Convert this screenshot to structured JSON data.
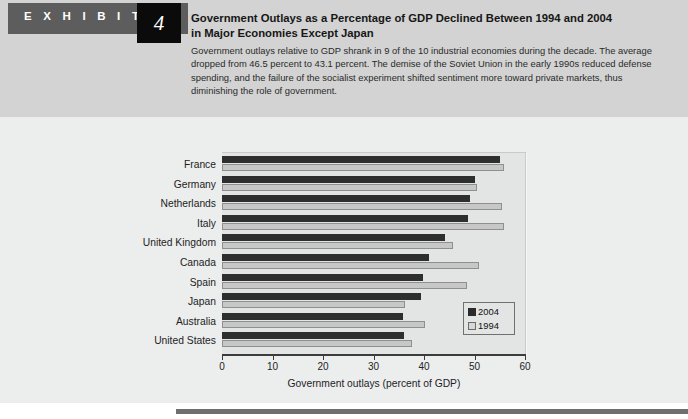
{
  "exhibit": {
    "label": "E X H I B I T",
    "number": "4"
  },
  "header": {
    "title_line1": "Government Outlays as a Percentage of GDP Declined Between 1994 and 2004",
    "title_line2": "in Major Economies Except Japan",
    "body": "Government outlays relative to GDP shrank in 9 of the 10 industrial economies during the decade. The average dropped from 46.5 percent to 43.1 percent. The demise of the Soviet Union in the early 1990s reduced defense spending, and the failure of the socialist experiment shifted sentiment more toward private markets, thus diminishing the role of government."
  },
  "chart_data": {
    "type": "bar",
    "orientation": "horizontal",
    "title": "",
    "xlabel": "Government outlays (percent of GDP)",
    "ylabel": "",
    "xlim": [
      0,
      60
    ],
    "xticks": [
      0,
      10,
      20,
      30,
      40,
      50,
      60
    ],
    "xtick_labels": [
      "0",
      "10",
      "20",
      "30",
      "40",
      "50",
      "60"
    ],
    "grid": false,
    "legend_position": "inside-bottom-right",
    "categories": [
      "France",
      "Germany",
      "Netherlands",
      "Italy",
      "United Kingdom",
      "Canada",
      "Spain",
      "Japan",
      "Australia",
      "United States"
    ],
    "series": [
      {
        "name": "2004",
        "color": "#2e2e2e",
        "values": [
          55.0,
          50.1,
          49.2,
          48.8,
          44.2,
          41.0,
          39.8,
          39.5,
          35.8,
          36.0
        ]
      },
      {
        "name": "1994",
        "color": "#c6c7c6",
        "values": [
          55.8,
          50.4,
          55.4,
          55.8,
          45.7,
          50.9,
          48.5,
          36.2,
          40.2,
          37.6
        ]
      }
    ]
  },
  "colors": {
    "header_band": "#d2d3d2",
    "chart_panel": "#eceded",
    "plot_area": "#e3e4e4",
    "axis": "#3c3c3c",
    "exhibit_tab": "#5c5d5c",
    "exhibit_num_box": "#0b0b0b",
    "footer_rule": "#6e6f6e"
  }
}
